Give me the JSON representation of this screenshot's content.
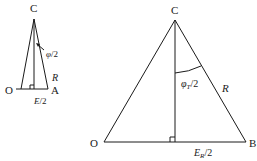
{
  "diagram": {
    "small_triangle": {
      "vertices": {
        "apex": "C",
        "left": "O",
        "right": "A"
      },
      "labels": {
        "apex": "C",
        "left": "O",
        "right": "A",
        "angle_sym": "φ",
        "angle_rest": "/2",
        "side": "R",
        "base_sym": "E",
        "base_rest": "/2"
      }
    },
    "large_triangle": {
      "vertices": {
        "apex": "C",
        "left": "O",
        "right": "B"
      },
      "labels": {
        "apex": "C",
        "left": "O",
        "right": "B",
        "angle_sym": "φ",
        "angle_sub": "T",
        "angle_rest": "/2",
        "side": "R",
        "base_sym": "E",
        "base_sub": "R",
        "base_rest": "/2"
      }
    },
    "colors": {
      "stroke": "#1a1a1a",
      "background": "#ffffff"
    }
  }
}
